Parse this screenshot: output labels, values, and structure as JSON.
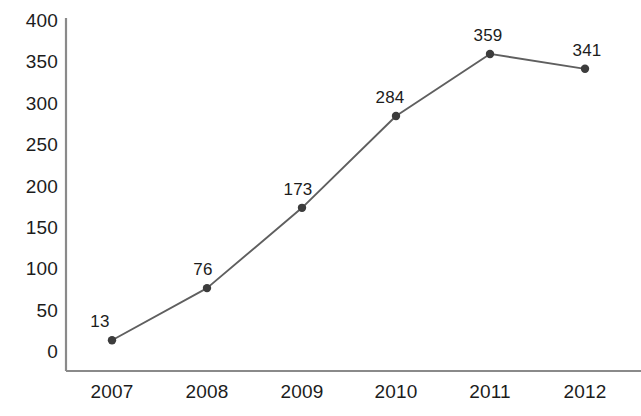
{
  "chart_data": {
    "type": "line",
    "title": "",
    "subtitle": "",
    "xlabel": "",
    "ylabel": "",
    "categories": [
      "2007",
      "2008",
      "2009",
      "2010",
      "2011",
      "2012"
    ],
    "values": [
      13,
      76,
      173,
      284,
      359,
      341
    ],
    "data_labels": [
      "13",
      "76",
      "173",
      "284",
      "359",
      "341"
    ],
    "series": [
      {
        "name": "",
        "values": [
          13,
          76,
          173,
          284,
          359,
          341
        ]
      }
    ],
    "ylim": [
      0,
      400
    ],
    "y_ticks": [
      0,
      50,
      100,
      150,
      200,
      250,
      300,
      350,
      400
    ],
    "y_tick_labels": [
      "0",
      "50",
      "100",
      "150",
      "200",
      "250",
      "300",
      "350",
      "400"
    ],
    "x_tick_labels": [
      "2007",
      "2008",
      "2009",
      "2010",
      "2011",
      "2012"
    ],
    "grid": false,
    "legend": false,
    "legend_position": "none",
    "markers": "circle",
    "colors": {
      "line": "#5f5f5f",
      "marker": "#3c3c3c",
      "axis": "#808080",
      "text": "#1c1c1c",
      "background": "#ffffff"
    }
  },
  "geometry": {
    "plot": {
      "axis_x": 66,
      "axis_top": 18,
      "axis_bottom": 371,
      "axis_right": 641,
      "value_zero_y": 351,
      "value_max_y": 20
    },
    "x_positions": [
      112,
      207,
      302,
      396,
      490,
      585
    ],
    "y_label_x": 58,
    "x_label_y": 382
  }
}
